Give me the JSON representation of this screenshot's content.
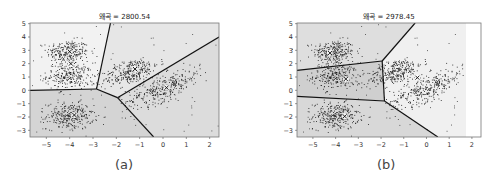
{
  "chart_data": [
    {
      "type": "scatter",
      "title": "왜곡 = 2800.54",
      "caption": "(a)",
      "xlabel": "",
      "ylabel": "",
      "xlim": [
        -5.7,
        2.4
      ],
      "ylim": [
        -3.5,
        5.05
      ],
      "xticks": [
        -5,
        -4,
        -3,
        -2,
        -1,
        0,
        1,
        2
      ],
      "yticks": [
        -3,
        -2,
        -1,
        0,
        1,
        2,
        3,
        4,
        5
      ],
      "grid": false,
      "description": "K-means decision boundaries (Voronoi) with 5 clusters over blob data",
      "centroids": [
        [
          -3.95,
          2.0
        ],
        [
          -3.8,
          -1.85
        ],
        [
          -1.2,
          1.6
        ],
        [
          0.15,
          0.2
        ],
        [
          -4.0,
          2.9
        ]
      ],
      "clusters": [
        {
          "center": [
            -4.1,
            2.9
          ],
          "spread": 0.45,
          "n": 260
        },
        {
          "center": [
            -4.0,
            1.1
          ],
          "spread": 0.5,
          "n": 260
        },
        {
          "center": [
            -4.0,
            -1.9
          ],
          "spread": 0.5,
          "n": 300
        },
        {
          "center": [
            -1.4,
            1.4
          ],
          "spread": [
            0.6,
            0.45
          ],
          "n": 300,
          "tilt": 0.5
        },
        {
          "center": [
            0.0,
            0.2
          ],
          "spread": [
            0.8,
            0.5
          ],
          "n": 330,
          "tilt": 0.65
        }
      ],
      "boundaries": [
        [
          [
            -5.7,
            0.0
          ],
          [
            -2.85,
            0.1
          ]
        ],
        [
          [
            -2.85,
            0.1
          ],
          [
            -2.25,
            5.05
          ]
        ],
        [
          [
            -2.85,
            0.1
          ],
          [
            -1.95,
            -0.55
          ]
        ],
        [
          [
            -1.95,
            -0.55
          ],
          [
            2.4,
            4.0
          ]
        ],
        [
          [
            -1.95,
            -0.55
          ],
          [
            -0.4,
            -3.5
          ]
        ]
      ],
      "regions": [
        {
          "poly": [
            [
              -5.7,
              5.05
            ],
            [
              -2.25,
              5.05
            ],
            [
              -2.85,
              0.1
            ],
            [
              -5.7,
              0.0
            ]
          ],
          "shade": "#f2f2f2"
        },
        {
          "poly": [
            [
              -2.25,
              5.05
            ],
            [
              2.4,
              5.05
            ],
            [
              2.4,
              4.0
            ],
            [
              -1.95,
              -0.55
            ],
            [
              -2.85,
              0.1
            ]
          ],
          "shade": "#e6e6e6"
        },
        {
          "poly": [
            [
              -5.7,
              0.0
            ],
            [
              -2.85,
              0.1
            ],
            [
              -1.95,
              -0.55
            ],
            [
              -0.4,
              -3.5
            ],
            [
              -5.7,
              -3.5
            ]
          ],
          "shade": "#d4d4d4"
        },
        {
          "poly": [
            [
              -1.95,
              -0.55
            ],
            [
              2.4,
              4.0
            ],
            [
              2.4,
              -3.5
            ],
            [
              -0.4,
              -3.5
            ]
          ],
          "shade": "#dcdcdc"
        }
      ]
    },
    {
      "type": "scatter",
      "title": "왜곡 = 2978.45",
      "caption": "(b)",
      "xlabel": "",
      "ylabel": "",
      "xlim": [
        -5.7,
        2.4
      ],
      "ylim": [
        -3.5,
        5.05
      ],
      "xticks": [
        -5,
        -4,
        -3,
        -2,
        -1,
        0,
        1,
        2
      ],
      "yticks": [
        -3,
        -2,
        -1,
        0,
        1,
        2,
        3,
        4,
        5
      ],
      "grid": false,
      "description": "K-means decision boundaries with different initialization; higher distortion",
      "centroids": [
        [
          -4.25,
          2.8
        ],
        [
          -3.55,
          0.85
        ],
        [
          -3.6,
          -1.95
        ],
        [
          -0.4,
          0.95
        ]
      ],
      "clusters": [
        {
          "center": [
            -4.1,
            2.9
          ],
          "spread": 0.45,
          "n": 260
        },
        {
          "center": [
            -4.0,
            1.1
          ],
          "spread": 0.5,
          "n": 260
        },
        {
          "center": [
            -4.0,
            -1.9
          ],
          "spread": 0.5,
          "n": 300
        },
        {
          "center": [
            -1.4,
            1.4
          ],
          "spread": [
            0.6,
            0.45
          ],
          "n": 300,
          "tilt": 0.5
        },
        {
          "center": [
            0.0,
            0.2
          ],
          "spread": [
            0.8,
            0.5
          ],
          "n": 330,
          "tilt": 0.65
        }
      ],
      "boundaries": [
        [
          [
            -5.7,
            1.5
          ],
          [
            -1.95,
            2.2
          ]
        ],
        [
          [
            -1.95,
            2.2
          ],
          [
            -0.5,
            5.05
          ]
        ],
        [
          [
            -1.95,
            2.2
          ],
          [
            -1.85,
            -0.8
          ]
        ],
        [
          [
            -5.7,
            -0.45
          ],
          [
            -1.85,
            -0.8
          ]
        ],
        [
          [
            -1.85,
            -0.8
          ],
          [
            0.5,
            -3.5
          ]
        ]
      ],
      "regions": [
        {
          "poly": [
            [
              -5.7,
              5.05
            ],
            [
              -0.5,
              5.05
            ],
            [
              -1.95,
              2.2
            ],
            [
              -5.7,
              1.5
            ]
          ],
          "shade": "#dedede"
        },
        {
          "poly": [
            [
              -5.7,
              1.5
            ],
            [
              -1.95,
              2.2
            ],
            [
              -1.85,
              -0.8
            ],
            [
              -5.7,
              -0.45
            ]
          ],
          "shade": "#cfcfcf"
        },
        {
          "poly": [
            [
              -5.7,
              -0.45
            ],
            [
              -1.85,
              -0.8
            ],
            [
              0.5,
              -3.5
            ],
            [
              -5.7,
              -3.5
            ]
          ],
          "shade": "#d8d8d8"
        },
        {
          "poly": [
            [
              -0.5,
              5.05
            ],
            [
              2.4,
              5.05
            ],
            [
              2.4,
              -3.5
            ],
            [
              0.5,
              -3.5
            ],
            [
              -1.85,
              -0.8
            ],
            [
              -1.95,
              2.2
            ]
          ],
          "shade": "#f0f0f0"
        }
      ]
    }
  ]
}
